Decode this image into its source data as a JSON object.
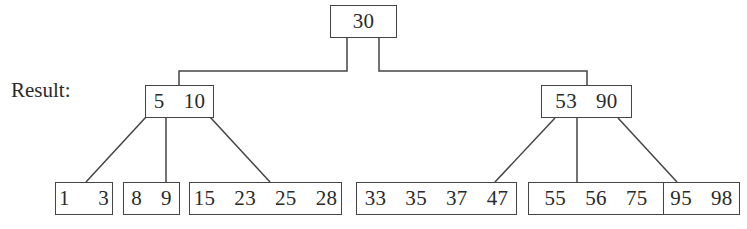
{
  "label": "Result:",
  "tree": {
    "root": {
      "keys": [
        "30"
      ],
      "text": "30"
    },
    "level1": [
      {
        "keys": [
          "5",
          "10"
        ],
        "text": "5  10"
      },
      {
        "keys": [
          "53",
          "90"
        ],
        "text": "53  90"
      }
    ],
    "leaves": [
      {
        "keys": [
          "1",
          "3"
        ],
        "text": "1   3"
      },
      {
        "keys": [
          "8",
          "9"
        ],
        "text": "8  9"
      },
      {
        "keys": [
          "15",
          "23",
          "25",
          "28"
        ],
        "text": "15  23  25  28"
      },
      {
        "keys": [
          "33",
          "35",
          "37",
          "47"
        ],
        "text": "33  35  37  47"
      },
      {
        "keys": [
          "55",
          "56",
          "75"
        ],
        "text": "55  56  75"
      },
      {
        "keys": [
          "95",
          "98"
        ],
        "text": "95  98"
      }
    ]
  },
  "colors": {
    "line": "#444444",
    "text": "#2a2a2a",
    "background": "#ffffff"
  }
}
